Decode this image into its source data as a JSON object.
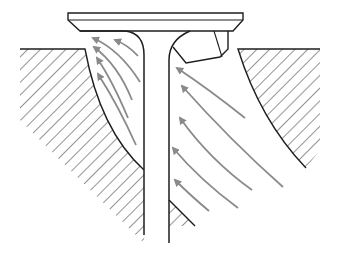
{
  "diagram": {
    "title": "",
    "colors": {
      "background": "#ffffff",
      "outline": "#1e1e1e",
      "hatch": "#3a3a3a",
      "flow_arrow": "#8a8a8a"
    },
    "components": [
      {
        "name": "valve-head",
        "label": ""
      },
      {
        "name": "valve-stem",
        "label": ""
      },
      {
        "name": "valve-seat-insert",
        "label": ""
      },
      {
        "name": "left-port-wall",
        "label": ""
      },
      {
        "name": "right-port-wall",
        "label": ""
      },
      {
        "name": "stem-guide-wedge",
        "label": ""
      }
    ],
    "flow_arrows": {
      "left": [
        {
          "from": [
            150,
            58
          ],
          "to": [
            115,
            40
          ]
        },
        {
          "from": [
            140,
            82
          ],
          "to": [
            93,
            38
          ]
        },
        {
          "from": [
            135,
            100
          ],
          "to": [
            94,
            47
          ]
        },
        {
          "from": [
            130,
            118
          ],
          "to": [
            97,
            58
          ]
        },
        {
          "from": [
            134,
            140
          ],
          "to": [
            98,
            74
          ]
        }
      ],
      "right": [
        {
          "from": [
            245,
            118
          ],
          "to": [
            177,
            68
          ]
        },
        {
          "from": [
            283,
            187
          ],
          "to": [
            182,
            86
          ]
        },
        {
          "from": [
            252,
            190
          ],
          "to": [
            180,
            118
          ]
        },
        {
          "from": [
            238,
            208
          ],
          "to": [
            173,
            148
          ]
        },
        {
          "from": [
            209,
            211
          ],
          "to": [
            175,
            180
          ]
        }
      ]
    }
  }
}
